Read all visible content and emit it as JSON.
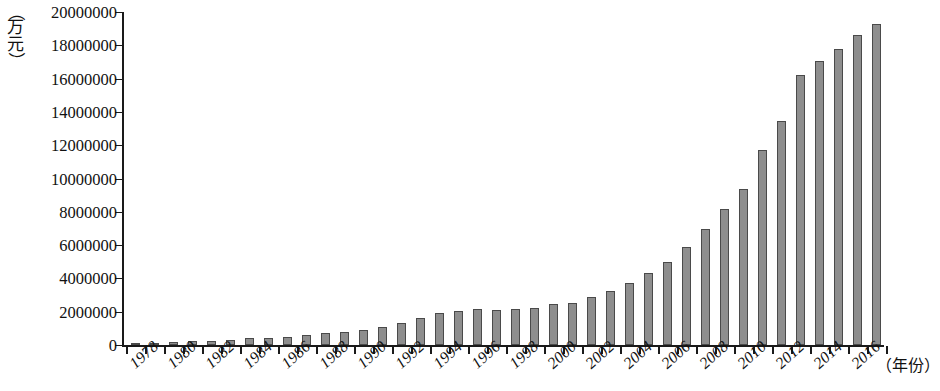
{
  "chart_data": {
    "type": "bar",
    "title": "",
    "subtitle": "",
    "xlabel": "（年份）",
    "ylabel": "（万元）",
    "ylim": [
      0,
      20000000
    ],
    "ytick_values": [
      0,
      2000000,
      4000000,
      6000000,
      8000000,
      10000000,
      12000000,
      14000000,
      16000000,
      18000000,
      20000000
    ],
    "ytick_labels": [
      "0",
      "2000000",
      "4000000",
      "6000000",
      "8000000",
      "10000000",
      "12000000",
      "14000000",
      "16000000",
      "18000000",
      "20000000"
    ],
    "grid": false,
    "legend": null,
    "bar_color": "#8e8e8e",
    "bar_edge_color": "#4a4a4a",
    "axis_color": "#1a1a1a",
    "xtick_label_rotation": -42,
    "xtick_label_interval": 2,
    "categories": [
      "1978",
      "1979",
      "1980",
      "1981",
      "1982",
      "1983",
      "1984",
      "1985",
      "1986",
      "1987",
      "1988",
      "1989",
      "1990",
      "1991",
      "1992",
      "1993",
      "1994",
      "1995",
      "1996",
      "1997",
      "1998",
      "1999",
      "2000",
      "2001",
      "2002",
      "2003",
      "2004",
      "2005",
      "2006",
      "2007",
      "2008",
      "2009",
      "2010",
      "2011",
      "2012",
      "2013",
      "2014",
      "2015",
      "2016",
      "2017"
    ],
    "xtick_labels_shown": [
      "1978",
      "1980",
      "1982",
      "1984",
      "1986",
      "1988",
      "1990",
      "1992",
      "1994",
      "1996",
      "1998",
      "2000",
      "2002",
      "2004",
      "2006",
      "2008",
      "2010",
      "2012",
      "2014",
      "2016"
    ],
    "values": [
      120000,
      150000,
      200000,
      230000,
      260000,
      300000,
      400000,
      450000,
      500000,
      600000,
      750000,
      800000,
      900000,
      1100000,
      1350000,
      1600000,
      1900000,
      2050000,
      2150000,
      2100000,
      2150000,
      2250000,
      2450000,
      2550000,
      2900000,
      3250000,
      3750000,
      4350000,
      5000000,
      5900000,
      6950000,
      8150000,
      9400000,
      11700000,
      13450000,
      16200000,
      17050000,
      17750000,
      18600000,
      19300000
    ]
  }
}
